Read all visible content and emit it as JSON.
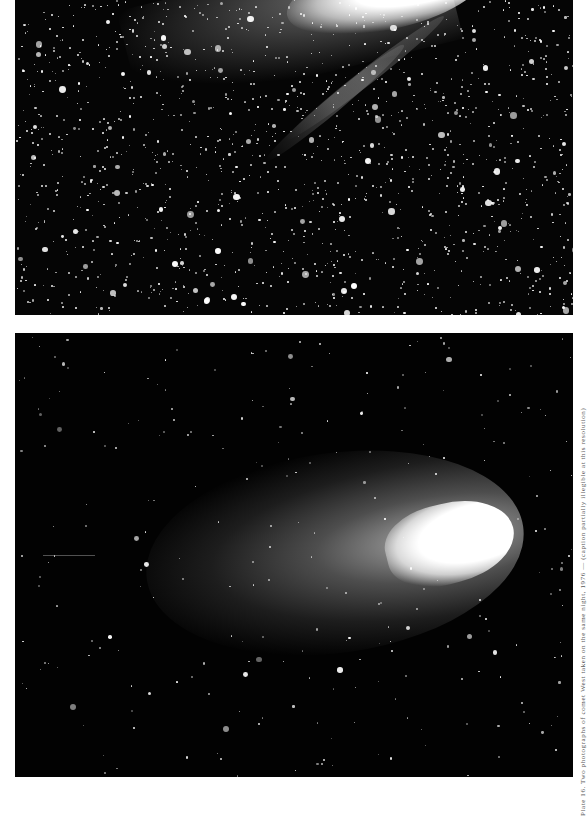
{
  "page": {
    "background": "#ffffff"
  },
  "plates": [
    {
      "id": "top",
      "description": "Dense star field with comet head and striated tail cropped at upper edge",
      "background": "#050505",
      "star_density": "high"
    },
    {
      "id": "bottom",
      "description": "Dark star field with bright comet head at right and broad diffuse dust tail extending left",
      "background": "#020202",
      "star_density": "low"
    }
  ],
  "caption": {
    "text": "Plate 16. Two photographs of comet West taken on the same night, 1976 — (caption partially illegible at this resolution)"
  }
}
